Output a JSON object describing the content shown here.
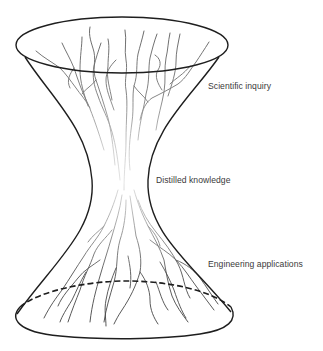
{
  "diagram": {
    "title": "",
    "shape": "hourglass-hyperboloid",
    "labels": {
      "top": "Scientific inquiry",
      "middle": "Distilled knowledge",
      "bottom": "Engineering applications"
    },
    "colors": {
      "outline": "#1e1e1e",
      "veins_dark": "#555555",
      "veins_faded": "#d6d6d6",
      "label_text": "#3a3a3a",
      "background": "#ffffff"
    }
  }
}
